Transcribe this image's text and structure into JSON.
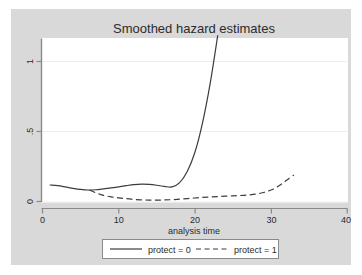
{
  "chart_data": {
    "type": "line",
    "title": "Smoothed hazard estimates",
    "xlabel": "analysis time",
    "ylabel": "",
    "xlim": [
      0,
      40
    ],
    "ylim": [
      0,
      1.2
    ],
    "xticks": [
      "0",
      "10",
      "20",
      "30",
      "40"
    ],
    "xtick_values": [
      0,
      10,
      20,
      30,
      40
    ],
    "yticks": [
      "0",
      ".5",
      "1"
    ],
    "ytick_values": [
      0,
      0.5,
      1
    ],
    "grid": "horizontal",
    "legend_position": "bottom",
    "series": [
      {
        "name": "protect = 0",
        "style": "solid",
        "color": "#3c3c3c",
        "x": [
          1.0,
          2.0,
          3.0,
          4.0,
          5.0,
          6.0,
          7.0,
          8.0,
          9.0,
          10.0,
          11.0,
          12.0,
          13.0,
          14.0,
          15.0,
          16.0,
          17.0,
          18.0,
          19.0,
          20.0,
          21.0,
          22.0,
          23.0
        ],
        "y": [
          0.118,
          0.113,
          0.104,
          0.094,
          0.086,
          0.082,
          0.084,
          0.09,
          0.097,
          0.105,
          0.113,
          0.12,
          0.124,
          0.122,
          0.116,
          0.108,
          0.104,
          0.135,
          0.215,
          0.35,
          0.56,
          0.84,
          1.185
        ]
      },
      {
        "name": "protect = 1",
        "style": "dashed",
        "color": "#3c3c3c",
        "x": [
          6.2,
          7.0,
          8.0,
          9.0,
          10.0,
          11.0,
          12.0,
          13.0,
          14.0,
          15.0,
          16.0,
          17.0,
          18.0,
          19.0,
          20.0,
          21.0,
          22.0,
          23.0,
          24.0,
          25.0,
          26.0,
          27.0,
          28.0,
          29.0,
          30.0,
          31.0,
          32.0,
          33.0
        ],
        "y": [
          0.082,
          0.062,
          0.044,
          0.033,
          0.026,
          0.02,
          0.015,
          0.012,
          0.01,
          0.01,
          0.011,
          0.013,
          0.017,
          0.021,
          0.025,
          0.029,
          0.032,
          0.035,
          0.038,
          0.04,
          0.043,
          0.047,
          0.053,
          0.064,
          0.082,
          0.11,
          0.15,
          0.19
        ]
      }
    ]
  },
  "legend": {
    "entries": [
      {
        "label": "protect = 0",
        "style": "solid"
      },
      {
        "label": "protect = 1",
        "style": "dashed"
      }
    ]
  },
  "colors": {
    "graph_background": "#d9d9d9",
    "plot_background": "#ffffff",
    "line": "#3c3c3c",
    "axis": "#8a8a8a",
    "gridline": "#ececec",
    "text": "#2b2b2b",
    "legend_border": "#8a8a8a"
  }
}
